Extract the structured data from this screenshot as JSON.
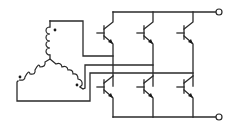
{
  "diagram": {
    "title": "",
    "colors": {
      "line": "#2a2a2a",
      "background": "#ffffff"
    },
    "components": {
      "windings": [
        {
          "id": "winding-a",
          "orientation": "vertical",
          "polarity_dot": true
        },
        {
          "id": "winding-b",
          "orientation": "left-diagonal",
          "polarity_dot": true
        },
        {
          "id": "winding-c",
          "orientation": "right-diagonal",
          "polarity_dot": true
        }
      ],
      "transistors": [
        {
          "id": "q1",
          "position": "upper",
          "leg": 1,
          "type": "npn"
        },
        {
          "id": "q2",
          "position": "upper",
          "leg": 2,
          "type": "npn"
        },
        {
          "id": "q3",
          "position": "upper",
          "leg": 3,
          "type": "npn"
        },
        {
          "id": "q4",
          "position": "lower",
          "leg": 1,
          "type": "npn"
        },
        {
          "id": "q5",
          "position": "lower",
          "leg": 2,
          "type": "npn"
        },
        {
          "id": "q6",
          "position": "lower",
          "leg": 3,
          "type": "npn"
        }
      ],
      "terminals": [
        {
          "id": "dc-positive",
          "label": ""
        },
        {
          "id": "dc-negative",
          "label": ""
        }
      ]
    }
  }
}
